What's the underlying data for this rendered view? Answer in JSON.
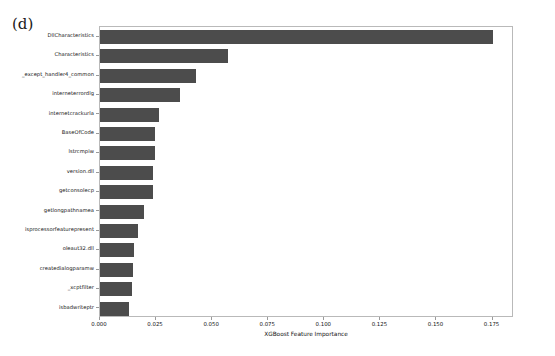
{
  "figure": {
    "panel_label": "(d)",
    "background_color": "#ffffff",
    "bar_color": "#4c4c4c",
    "axis_color": "#b9b9b9"
  },
  "chart_data": {
    "type": "bar",
    "orientation": "horizontal",
    "title": "",
    "subtitle": "",
    "xlabel": "XGBoost Feature Importance",
    "ylabel": "",
    "xlim": [
      0.0,
      0.18457
    ],
    "xticks": [
      0.0,
      0.025,
      0.05,
      0.075,
      0.1,
      0.125,
      0.15,
      0.175
    ],
    "xtick_labels": [
      "0.000",
      "0.025",
      "0.050",
      "0.075",
      "0.100",
      "0.125",
      "0.150",
      "0.175"
    ],
    "grid": false,
    "legend": null,
    "categories": [
      "DllCharacteristics",
      "Characteristics",
      "_except_handler4_common",
      "interneterrordlg",
      "internetcrackurla",
      "BaseOfCode",
      "lstrcmpiw",
      "version.dll",
      "getconsolecp",
      "getlongpathnamea",
      "isprocessorfeaturepresent",
      "oleaut32.dll",
      "createdialogparamw",
      "_xcptfilter",
      "isbadwriteptr"
    ],
    "values": [
      0.175,
      0.0572,
      0.0428,
      0.0356,
      0.0263,
      0.0246,
      0.0246,
      0.0237,
      0.0237,
      0.0195,
      0.017,
      0.0153,
      0.0148,
      0.0142,
      0.0131
    ]
  }
}
